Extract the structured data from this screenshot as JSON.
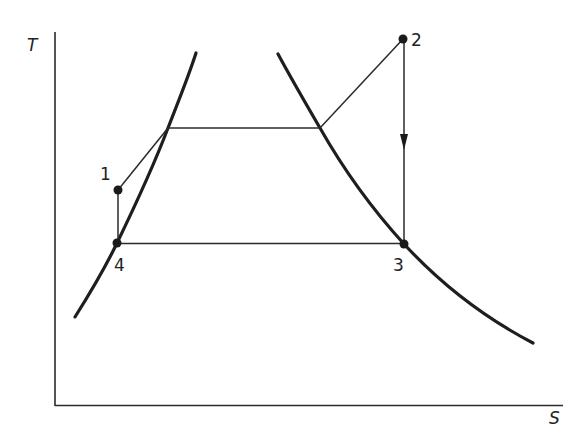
{
  "diagram": {
    "type": "T-S diagram (vapor cycle)",
    "axes": {
      "y_label": "T",
      "x_label": "S"
    },
    "saturation_dome": {
      "left_curve": "saturated liquid line",
      "right_curve": "saturated vapor line"
    },
    "states": [
      {
        "id": "1",
        "label": "1"
      },
      {
        "id": "2",
        "label": "2"
      },
      {
        "id": "3",
        "label": "3"
      },
      {
        "id": "4",
        "label": "4"
      }
    ],
    "processes": [
      {
        "from": "1",
        "to": "2",
        "path": "heating across upper isotherm (constant pressure)"
      },
      {
        "from": "2",
        "to": "3",
        "path": "vertical isentropic, arrow pointing down"
      },
      {
        "from": "3",
        "to": "4",
        "path": "horizontal, lower isotherm"
      },
      {
        "from": "4",
        "to": "1",
        "path": "vertical short segment"
      }
    ],
    "colors": {
      "line": "#1e1e1e",
      "background": "#ffffff"
    }
  }
}
